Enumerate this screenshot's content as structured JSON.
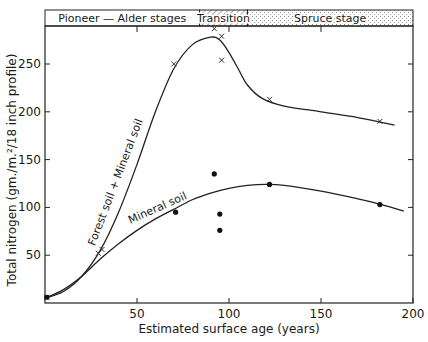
{
  "chart_data": {
    "type": "scatter",
    "title": "",
    "xlabel": "Estimated surface age (years)",
    "ylabel": "Total nitrogen (gm./m.²/18 inch profile)",
    "xlim": [
      0,
      200
    ],
    "ylim": [
      0,
      290
    ],
    "x_ticks": [
      50,
      100,
      150,
      200
    ],
    "y_ticks": [
      50,
      100,
      150,
      200,
      250
    ],
    "grid": false,
    "stage_bands": [
      {
        "label": "Pioneer — Alder stages",
        "from": 0,
        "to": 84,
        "fill": "plain"
      },
      {
        "label": "Transition",
        "from": 84,
        "to": 110,
        "fill": "hatched"
      },
      {
        "label": "Spruce stage",
        "from": 110,
        "to": 200,
        "fill": "stippled"
      }
    ],
    "series": [
      {
        "name": "Forest soil + Mineral soil",
        "marker": "x",
        "points": [
          [
            1,
            6
          ],
          [
            29,
            52
          ],
          [
            31,
            56
          ],
          [
            70,
            250
          ],
          [
            92,
            287
          ],
          [
            96,
            279
          ],
          [
            96,
            254
          ],
          [
            122,
            213
          ],
          [
            182,
            190
          ]
        ],
        "curve": [
          [
            0,
            5
          ],
          [
            10,
            12
          ],
          [
            20,
            28
          ],
          [
            30,
            55
          ],
          [
            40,
            95
          ],
          [
            50,
            145
          ],
          [
            60,
            200
          ],
          [
            70,
            245
          ],
          [
            80,
            270
          ],
          [
            90,
            278
          ],
          [
            95,
            275
          ],
          [
            100,
            262
          ],
          [
            105,
            245
          ],
          [
            110,
            228
          ],
          [
            118,
            214
          ],
          [
            130,
            206
          ],
          [
            150,
            200
          ],
          [
            170,
            194
          ],
          [
            190,
            186
          ]
        ],
        "curve_label": "Forest soil + Mineral soil"
      },
      {
        "name": "Mineral soil",
        "marker": "dot",
        "points": [
          [
            1,
            6
          ],
          [
            71,
            95
          ],
          [
            92,
            135
          ],
          [
            95,
            93
          ],
          [
            95,
            76
          ],
          [
            122,
            124
          ],
          [
            182,
            103
          ]
        ],
        "curve": [
          [
            0,
            5
          ],
          [
            10,
            14
          ],
          [
            20,
            28
          ],
          [
            30,
            46
          ],
          [
            40,
            62
          ],
          [
            50,
            76
          ],
          [
            60,
            88
          ],
          [
            70,
            98
          ],
          [
            80,
            108
          ],
          [
            90,
            115
          ],
          [
            100,
            120
          ],
          [
            110,
            123
          ],
          [
            120,
            124
          ],
          [
            130,
            123
          ],
          [
            150,
            117
          ],
          [
            170,
            109
          ],
          [
            183,
            103
          ],
          [
            195,
            96
          ]
        ],
        "curve_label": "Mineral soil"
      }
    ]
  },
  "labels": {
    "xlabel": "Estimated surface age (years)",
    "ylabel": "Total nitrogen (gm./m.²/18 inch profile)",
    "band_pioneer": "Pioneer — Alder stages",
    "band_transition": "Transition",
    "band_spruce": "Spruce stage",
    "curve_upper": "Forest soil + Mineral soil",
    "curve_lower": "Mineral soil"
  }
}
